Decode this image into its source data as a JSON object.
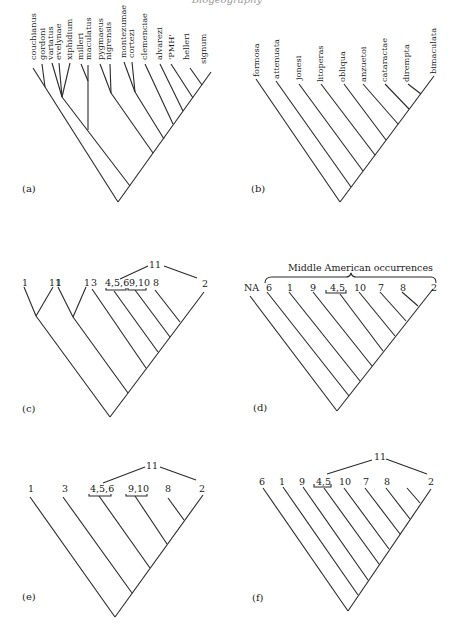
{
  "header": {
    "text": "Biogeography"
  },
  "panels": {
    "a": {
      "label": "(a)",
      "taxa": [
        "couchianus",
        "gordoni",
        "variatus",
        "evelynae",
        "xiphidium",
        "milleri",
        "maculatus",
        "pygmaeus",
        "nigrensis",
        "montezumae",
        "cortezi",
        "clemenciae",
        "alvarezi",
        "'PMH'",
        "helleri",
        "signum"
      ]
    },
    "b": {
      "label": "(b)",
      "taxa": [
        "formosa",
        "attenuata",
        "jonesi",
        "litoperas",
        "obliqua",
        "anzuetoi",
        "cataractae",
        "dirempta",
        "bimaculata"
      ]
    },
    "c": {
      "label": "(c)",
      "terminals": [
        "1",
        "11",
        "1",
        "1",
        "3",
        "4,5,6",
        "9,10",
        "8",
        "2"
      ],
      "top_area": "11"
    },
    "d": {
      "label": "(d)",
      "bracket_label": "Middle American occurrences",
      "terminals": [
        "NA",
        "6",
        "1",
        "9",
        "4,5",
        "10",
        "7",
        "8",
        "2"
      ]
    },
    "e": {
      "label": "(e)",
      "terminals": [
        "1",
        "3",
        "4,5,6",
        "9,10",
        "8",
        "2"
      ],
      "top_area": "11"
    },
    "f": {
      "label": "(f)",
      "terminals": [
        "6",
        "1",
        "9",
        "4,5",
        "10",
        "7",
        "8",
        "2"
      ],
      "top_area": "11"
    }
  }
}
